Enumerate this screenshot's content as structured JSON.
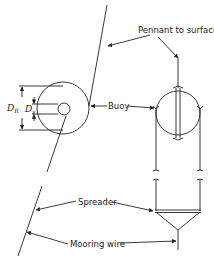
{
  "diagram": {
    "type": "mooring buoy schematic",
    "colors": {
      "line": "#222222",
      "background": "#ffffff"
    },
    "labels": {
      "pennant": "Pennant to surface",
      "buoy": "Buoy",
      "spreader": "Spreader",
      "mooring_wire": "Mooring wire"
    },
    "dimensions": {
      "outer_diameter": {
        "symbol": "D",
        "subscript": "R"
      },
      "inner_diameter": {
        "symbol": "D",
        "subscript": "s"
      }
    },
    "views": [
      "side view (left)",
      "front view (right)"
    ]
  }
}
